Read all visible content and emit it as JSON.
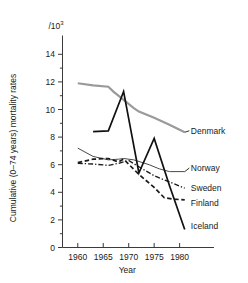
{
  "chart_data": {
    "type": "line",
    "title": "",
    "xlabel": "Year",
    "ylabel": "Cumulative (0–74 years) mortality rates",
    "unit_label": "/10",
    "unit_exponent": "3",
    "xlim": [
      1957,
      1984
    ],
    "ylim": [
      0,
      15
    ],
    "xticks": [
      1960,
      1965,
      1970,
      1975,
      1980
    ],
    "xtick_labels": [
      "1960",
      "1965",
      "1970",
      "1975",
      "1980"
    ],
    "yticks": [
      0,
      2,
      4,
      6,
      8,
      10,
      12,
      14
    ],
    "ytick_labels": [
      "0",
      "2",
      "4",
      "6",
      "8",
      "10",
      "12",
      "14"
    ],
    "yminorticks": [
      1,
      3,
      5,
      7,
      9,
      11,
      13
    ],
    "grid": false,
    "legend_position": "right-inline-labels",
    "series": [
      {
        "name": "Denmark",
        "color": "#9a9a9a",
        "width": 2.2,
        "dash": "none",
        "label_x": 1982.2,
        "label_y": 8.3,
        "x": [
          1960,
          1963,
          1966,
          1967,
          1969,
          1971,
          1972,
          1975,
          1978,
          1981
        ],
        "y": [
          11.9,
          11.75,
          11.65,
          11.3,
          10.7,
          10.1,
          9.85,
          9.4,
          8.9,
          8.35
        ]
      },
      {
        "name": "Norway",
        "color": "#4a4a4a",
        "width": 1.0,
        "dash": "none",
        "label_x": 1982.2,
        "label_y": 5.6,
        "x": [
          1960,
          1963,
          1966,
          1968,
          1969,
          1971,
          1974,
          1976,
          1978,
          1981
        ],
        "y": [
          7.2,
          6.6,
          6.35,
          6.4,
          6.45,
          6.35,
          6.0,
          5.7,
          5.5,
          5.5
        ]
      },
      {
        "name": "Sweden",
        "color": "#1a1a1a",
        "width": 1.3,
        "dash": "5,2,1.3,2",
        "label_x": 1982.2,
        "label_y": 4.2,
        "x": [
          1960,
          1963,
          1966,
          1968,
          1970,
          1972,
          1975,
          1978,
          1981
        ],
        "y": [
          6.1,
          6.05,
          5.95,
          6.1,
          6.3,
          5.85,
          5.2,
          4.75,
          4.3
        ]
      },
      {
        "name": "Finland",
        "color": "#1a1a1a",
        "width": 1.7,
        "dash": "4.5,2.6",
        "label_x": 1982.2,
        "label_y": 3.1,
        "x": [
          1960,
          1963,
          1966,
          1968,
          1969,
          1972,
          1975,
          1977,
          1979,
          1981
        ],
        "y": [
          6.15,
          6.4,
          6.45,
          6.2,
          6.4,
          5.3,
          4.35,
          3.6,
          3.5,
          3.45
        ]
      },
      {
        "name": "Iceland",
        "color": "#111111",
        "width": 1.7,
        "dash": "none",
        "label_x": 1982.2,
        "label_y": 1.4,
        "x": [
          1963,
          1966,
          1969,
          1972,
          1975,
          1978,
          1981
        ],
        "y": [
          8.4,
          8.45,
          11.3,
          5.4,
          7.9,
          4.5,
          1.3
        ]
      }
    ]
  }
}
